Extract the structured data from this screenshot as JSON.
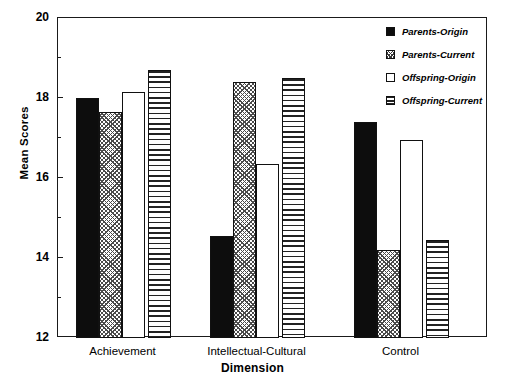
{
  "chart_data": {
    "type": "bar",
    "title": "",
    "xlabel": "Dimension",
    "ylabel": "Mean Scores",
    "categories": [
      "Achievement",
      "Intellectual-Cultural",
      "Control"
    ],
    "series": [
      {
        "name": "Parents-Origin",
        "pattern": "solid",
        "values": [
          18.0,
          14.55,
          17.4
        ]
      },
      {
        "name": "Parents-Current",
        "pattern": "crosshatch",
        "values": [
          17.65,
          18.4,
          14.2
        ]
      },
      {
        "name": "Offspring-Origin",
        "pattern": "empty",
        "values": [
          18.15,
          16.35,
          16.95
        ]
      },
      {
        "name": "Offspring-Current",
        "pattern": "hlines",
        "values": [
          18.7,
          18.5,
          14.45
        ]
      }
    ],
    "ylim": [
      12,
      20
    ],
    "y_major_ticks": [
      12,
      14,
      16,
      18,
      20
    ],
    "y_minor_ticks": [
      13,
      15,
      17,
      19
    ],
    "y_tick_labels": [
      "12",
      "14",
      "16",
      "18",
      "20"
    ],
    "grid": false,
    "legend_position": "top-right"
  },
  "axes": {
    "y_title": "Mean Scores",
    "x_title": "Dimension"
  },
  "legend": {
    "entries": [
      {
        "label": "Parents-Origin"
      },
      {
        "label": "Parents-Current"
      },
      {
        "label": "Offspring-Origin"
      },
      {
        "label": "Offspring-Current"
      }
    ]
  }
}
